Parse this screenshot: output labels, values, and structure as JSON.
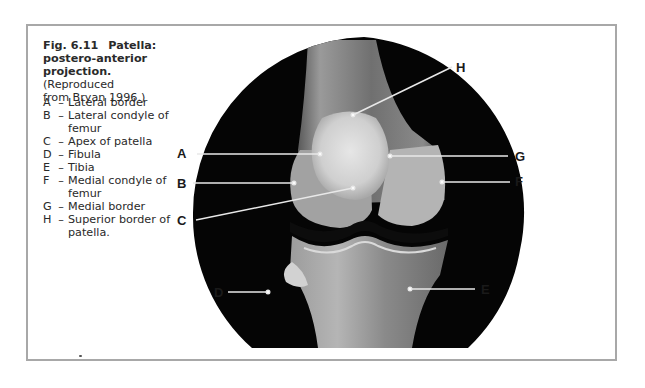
{
  "figure": {
    "number": "Fig. 6.11",
    "title": "Patella: postero-anterior projection.",
    "title_line1": "Patella:",
    "title_line2": "postero-anterior",
    "title_line3": "projection.",
    "source_line3": "(Reproduced",
    "source_line4": "from Bryan 1996.)"
  },
  "legend": [
    {
      "key": "A",
      "lines": [
        "Lateral border"
      ]
    },
    {
      "key": "B",
      "lines": [
        "Lateral condyle of",
        "femur"
      ]
    },
    {
      "key": "C",
      "lines": [
        "Apex of patella"
      ]
    },
    {
      "key": "D",
      "lines": [
        "Fibula"
      ]
    },
    {
      "key": "E",
      "lines": [
        "Tibia"
      ]
    },
    {
      "key": "F",
      "lines": [
        "Medial condyle of",
        "femur"
      ]
    },
    {
      "key": "G",
      "lines": [
        "Medial border"
      ]
    },
    {
      "key": "H",
      "lines": [
        "Superior border of",
        "patella."
      ]
    }
  ],
  "image_labels": {
    "A": "A",
    "B": "B",
    "C": "C",
    "D": "D",
    "E": "E",
    "F": "F",
    "G": "G",
    "H": "H"
  },
  "colors": {
    "frame": "#a8a8a8",
    "background": "#ffffff",
    "xray_background": "#050505",
    "leader_line": "#e8e8e8"
  }
}
